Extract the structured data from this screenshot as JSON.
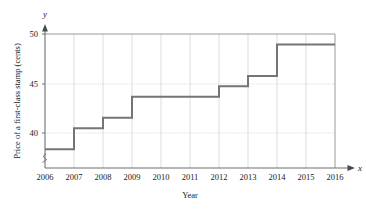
{
  "chart_data": {
    "type": "line",
    "subtype": "step",
    "title": "",
    "xlabel": "Year",
    "ylabel": "Price of a first-class stamp (cents)",
    "x_axis_letter": "x",
    "y_axis_letter": "y",
    "categories": [
      2006,
      2007,
      2008,
      2009,
      2010,
      2011,
      2012,
      2013,
      2014,
      2015,
      2016
    ],
    "x_tick_labels": [
      "2006",
      "2007",
      "2008",
      "2009",
      "2010",
      "2011",
      "2012",
      "2013",
      "2014",
      "2015",
      "2016"
    ],
    "values": [
      39,
      41,
      42,
      44,
      44,
      44,
      45,
      46,
      49,
      49,
      49
    ],
    "series": [
      {
        "name": "Price of a first-class stamp (cents)",
        "values": [
          39,
          41,
          42,
          44,
          44,
          44,
          45,
          46,
          49,
          49,
          49
        ]
      }
    ],
    "y_tick_labels": [
      "40",
      "45",
      "50"
    ],
    "y_ticks": [
      40,
      45,
      50
    ],
    "ylim": [
      37.2,
      50
    ],
    "xlim": [
      2006,
      2016
    ],
    "grid": true,
    "grid_x": true,
    "grid_y": true,
    "legend": false,
    "legend_position": "none",
    "y_axis_break": true,
    "annotations": [],
    "colors": {
      "step_line": "#6e6e6e",
      "grid": "#c9c9c9",
      "axis": "#8a8a8a",
      "text": "#1a1a1a",
      "background": "#ffffff"
    }
  }
}
